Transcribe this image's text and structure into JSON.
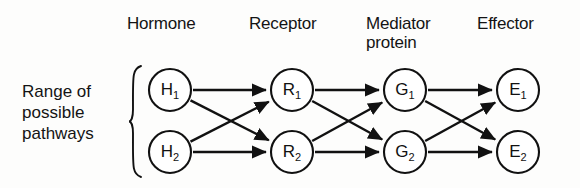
{
  "diagram": {
    "title_label": "Range of\npossible\npathways",
    "background_color": "#fdfdfc",
    "stroke_color": "#111111",
    "columns": [
      {
        "id": "hormone",
        "header": "Hormone",
        "cx": 170
      },
      {
        "id": "receptor",
        "header": "Receptor",
        "cx": 292
      },
      {
        "id": "mediator",
        "header": "Mediator\nprotein",
        "cx": 405
      },
      {
        "id": "effector",
        "header": "Effector",
        "cx": 518
      }
    ],
    "nodes": [
      {
        "id": "H1",
        "label": "H",
        "subscript": "1",
        "column": "hormone",
        "cx": 170,
        "cy": 90,
        "r": 21
      },
      {
        "id": "H2",
        "label": "H",
        "subscript": "2",
        "column": "hormone",
        "cx": 170,
        "cy": 152,
        "r": 21
      },
      {
        "id": "R1",
        "label": "R",
        "subscript": "1",
        "column": "receptor",
        "cx": 292,
        "cy": 90,
        "r": 21
      },
      {
        "id": "R2",
        "label": "R",
        "subscript": "2",
        "column": "receptor",
        "cx": 292,
        "cy": 152,
        "r": 21
      },
      {
        "id": "G1",
        "label": "G",
        "subscript": "1",
        "column": "mediator",
        "cx": 405,
        "cy": 90,
        "r": 21
      },
      {
        "id": "G2",
        "label": "G",
        "subscript": "2",
        "column": "mediator",
        "cx": 405,
        "cy": 152,
        "r": 21
      },
      {
        "id": "E1",
        "label": "E",
        "subscript": "1",
        "column": "effector",
        "cx": 518,
        "cy": 90,
        "r": 21
      },
      {
        "id": "E2",
        "label": "E",
        "subscript": "2",
        "column": "effector",
        "cx": 518,
        "cy": 152,
        "r": 21
      }
    ],
    "edges": [
      {
        "from": "H1",
        "to": "R1"
      },
      {
        "from": "H1",
        "to": "R2"
      },
      {
        "from": "H2",
        "to": "R1"
      },
      {
        "from": "H2",
        "to": "R2"
      },
      {
        "from": "R1",
        "to": "G1"
      },
      {
        "from": "R1",
        "to": "G2"
      },
      {
        "from": "R2",
        "to": "G1"
      },
      {
        "from": "R2",
        "to": "G2"
      },
      {
        "from": "G1",
        "to": "E1"
      },
      {
        "from": "G1",
        "to": "E2"
      },
      {
        "from": "G2",
        "to": "E1"
      },
      {
        "from": "G2",
        "to": "E2"
      }
    ],
    "brace": {
      "x": 130,
      "top": 66,
      "bottom": 177
    }
  }
}
